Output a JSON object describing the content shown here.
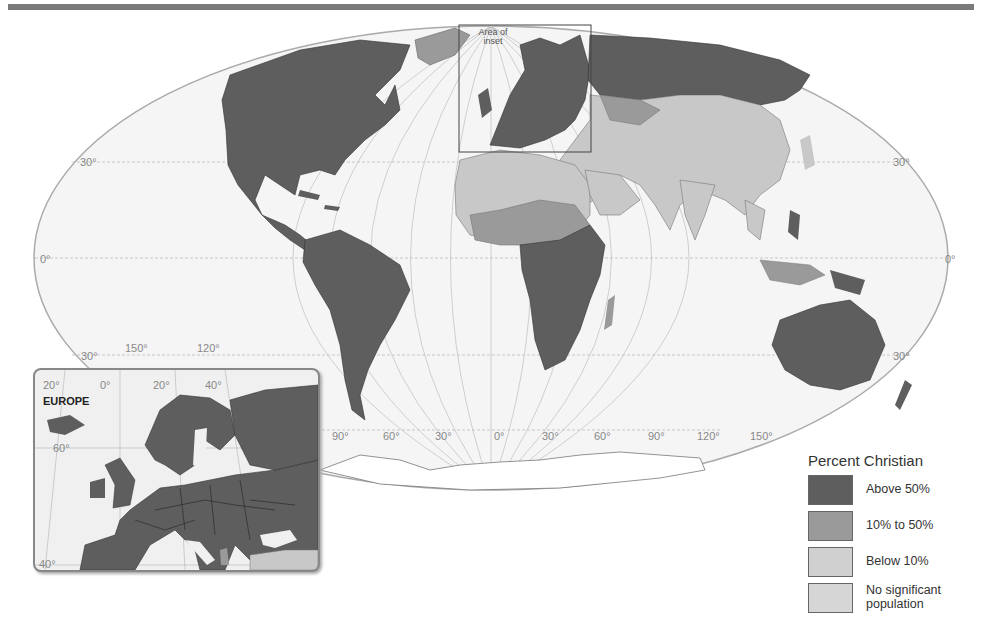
{
  "map": {
    "type": "thematic world map",
    "projection": "Mollweide-like",
    "latitude_labels": [
      "30°",
      "0°",
      "30°"
    ],
    "longitude_labels": [
      "150°",
      "120°",
      "90°",
      "60°",
      "30°",
      "0°",
      "30°",
      "60°",
      "90°",
      "120°",
      "150°"
    ],
    "area_of_inset_label": "Area of inset",
    "colors": {
      "above_50": "#5e5e5e",
      "between_10_50": "#9a9a9a",
      "below_10": "#c8c8c8",
      "no_significant": "#d9d9d9",
      "ocean": "#f3f3f3",
      "grid": "#b5b5b5"
    }
  },
  "inset": {
    "title": "EUROPE",
    "longitude_labels": [
      "20°",
      "0°",
      "20°",
      "40°"
    ],
    "latitude_labels": [
      "60°",
      "40°"
    ]
  },
  "legend": {
    "title": "Percent Christian",
    "items": [
      {
        "label": "Above 50%",
        "color": "#5e5e5e"
      },
      {
        "label": "10% to 50%",
        "color": "#9a9a9a"
      },
      {
        "label": "Below 10%",
        "color": "#c8c8c8"
      },
      {
        "label": "No significant population",
        "color": "#d6d6d6"
      }
    ]
  }
}
